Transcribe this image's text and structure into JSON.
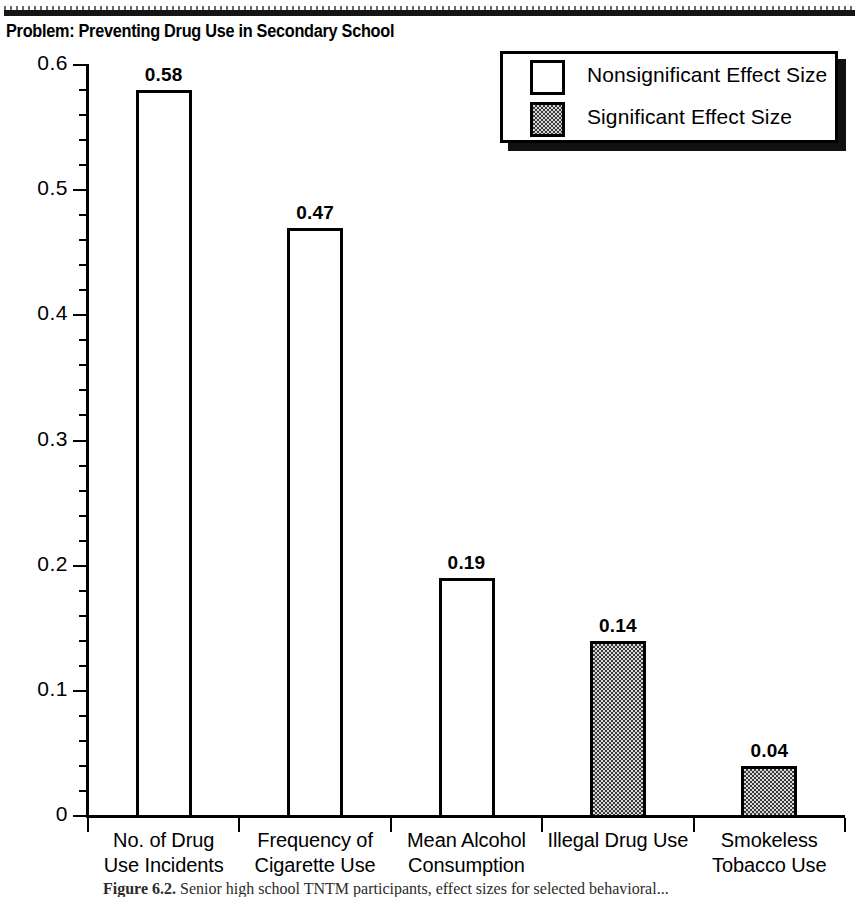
{
  "page": {
    "title": "Problem: Preventing Drug Use in Secondary School"
  },
  "caption": {
    "figure_label": "Figure 6.2.",
    "text": "Senior high school TNTM participants, effect sizes for selected behavioral..."
  },
  "legend": {
    "items": [
      {
        "label": "Nonsignificant Effect Size",
        "swatch": "open-square",
        "color": "#ffffff"
      },
      {
        "label": "Significant Effect Size",
        "swatch": "hatched-square",
        "color": "#8c8c8c"
      }
    ]
  },
  "yaxis": {
    "labels": [
      "0.6",
      "0.5",
      "0.4",
      "0.3",
      "0.2",
      "0.1",
      "0"
    ]
  },
  "chart_data": {
    "type": "bar",
    "title": "Problem: Preventing Drug Use in Secondary School",
    "xlabel": "",
    "ylabel": "",
    "ylim": [
      0,
      0.6
    ],
    "ytick_step": 0.1,
    "yminor_step": 0.02,
    "grid": false,
    "legend_position": "top-right",
    "categories": [
      "No. of Drug Use Incidents",
      "Frequency of Cigarette Use",
      "Mean Alcohol Consumption",
      "Illegal Drug Use",
      "Smokeless Tobacco Use"
    ],
    "category_lines": [
      [
        "No. of Drug",
        "Use Incidents"
      ],
      [
        "Frequency of",
        "Cigarette Use"
      ],
      [
        "Mean Alcohol",
        "Consumption"
      ],
      [
        "Illegal Drug Use"
      ],
      [
        "Smokeless",
        "Tobacco Use"
      ]
    ],
    "values": [
      0.58,
      0.47,
      0.19,
      0.14,
      0.04
    ],
    "value_labels": [
      "0.58",
      "0.47",
      "0.19",
      "0.14",
      "0.04"
    ],
    "significance": [
      "nonsignificant",
      "nonsignificant",
      "nonsignificant",
      "significant",
      "significant"
    ]
  }
}
